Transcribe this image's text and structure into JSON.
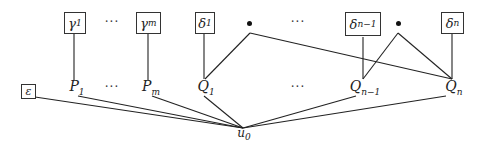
{
  "diagram": {
    "top_nodes": [
      {
        "id": "gamma1",
        "symbol": "γ",
        "sub": "1"
      },
      {
        "id": "gammam",
        "symbol": "γ",
        "sub": "m"
      },
      {
        "id": "delta1",
        "symbol": "δ",
        "sub": "1"
      },
      {
        "id": "deltan1",
        "symbol": "δ",
        "sub": "n−1"
      },
      {
        "id": "deltan",
        "symbol": "δ",
        "sub": "n"
      }
    ],
    "epsilon": {
      "symbol": "ε"
    },
    "middle_nodes": [
      {
        "id": "P1",
        "symbol": "P",
        "sub": "1"
      },
      {
        "id": "Pm",
        "symbol": "P",
        "sub": "m"
      },
      {
        "id": "Q1",
        "symbol": "Q",
        "sub": "1"
      },
      {
        "id": "Qn1",
        "symbol": "Q",
        "sub": "n−1"
      },
      {
        "id": "Qn",
        "symbol": "Q",
        "sub": "n"
      }
    ],
    "root": {
      "symbol": "u",
      "sub": "0"
    },
    "ellipsis": "···",
    "edges": [
      [
        "gamma1",
        "P1"
      ],
      [
        "gammam",
        "Pm"
      ],
      [
        "delta1",
        "Q1"
      ],
      [
        "bullet1",
        "Q1"
      ],
      [
        "bullet1",
        "Qn"
      ],
      [
        "deltan1",
        "Qn1"
      ],
      [
        "bullet2",
        "Qn1"
      ],
      [
        "bullet2",
        "Qn"
      ],
      [
        "deltan",
        "Qn"
      ],
      [
        "epsilon",
        "u0"
      ],
      [
        "P1",
        "u0"
      ],
      [
        "Pm",
        "u0"
      ],
      [
        "Q1",
        "u0"
      ],
      [
        "Qn1",
        "u0"
      ],
      [
        "Qn",
        "u0"
      ]
    ]
  }
}
